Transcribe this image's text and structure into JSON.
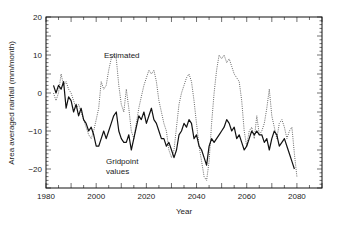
{
  "chart_data": {
    "type": "line",
    "title": "",
    "xlabel": "Year",
    "ylabel": "Area averaged rainfall (mm/month)",
    "xlim": [
      1980,
      2090
    ],
    "ylim": [
      -25,
      20
    ],
    "x_ticks": [
      1980,
      2000,
      2020,
      2040,
      2060,
      2080
    ],
    "x_tick_labels": [
      "1980",
      "2000",
      "2020",
      "2040",
      "2060",
      "2080"
    ],
    "y_ticks": [
      20,
      10,
      0,
      -10,
      -20
    ],
    "y_tick_labels": [
      "20",
      "10",
      "0",
      "−10",
      "−20"
    ],
    "grid": false,
    "legend": "none (inline annotations)",
    "annotations": [
      {
        "text": "Estimated",
        "x": 2009,
        "y": 14
      },
      {
        "text": "Gridpoint",
        "x": 2006,
        "y": -15
      },
      {
        "text": "values",
        "x": 2006,
        "y": -19
      }
    ],
    "series": [
      {
        "name": "Gridpoint values",
        "style": "solid",
        "color": "#111111",
        "x": [
          1983,
          1984,
          1985,
          1986,
          1987,
          1988,
          1989,
          1990,
          1991,
          1992,
          1993,
          1994,
          1995,
          1996,
          1997,
          1998,
          1999,
          2000,
          2001,
          2002,
          2003,
          2004,
          2005,
          2006,
          2007,
          2008,
          2009,
          2010,
          2011,
          2012,
          2013,
          2014,
          2015,
          2016,
          2017,
          2018,
          2019,
          2020,
          2021,
          2022,
          2023,
          2024,
          2025,
          2026,
          2027,
          2028,
          2029,
          2030,
          2031,
          2032,
          2033,
          2034,
          2035,
          2036,
          2037,
          2038,
          2039,
          2040,
          2041,
          2042,
          2043,
          2044,
          2045,
          2046,
          2047,
          2048,
          2049,
          2050,
          2051,
          2052,
          2053,
          2054,
          2055,
          2056,
          2057,
          2058,
          2059,
          2060,
          2061,
          2062,
          2063,
          2064,
          2065,
          2066,
          2067,
          2068,
          2069,
          2070,
          2071,
          2072,
          2073,
          2074,
          2075,
          2076,
          2077,
          2078,
          2079
        ],
        "values": [
          2,
          0,
          2,
          1,
          3,
          -4,
          -1,
          -2,
          -5,
          -3,
          -6,
          -4,
          -7,
          -8,
          -10,
          -9,
          -11,
          -14,
          -14,
          -12,
          -10,
          -12,
          -10,
          -8,
          -6,
          -5,
          -10,
          -12,
          -13,
          -13,
          -11,
          -15,
          -12,
          -9,
          -6,
          -7,
          -5,
          -8,
          -6,
          -4,
          -7,
          -8,
          -10,
          -12,
          -12,
          -14,
          -13,
          -15,
          -17,
          -15,
          -11,
          -10,
          -8,
          -9,
          -7,
          -8,
          -12,
          -11,
          -14,
          -15,
          -17,
          -19,
          -14,
          -12,
          -13,
          -12,
          -11,
          -10,
          -9,
          -7,
          -8,
          -10,
          -9,
          -12,
          -11,
          -13,
          -15,
          -14,
          -12,
          -10,
          -11,
          -10,
          -11,
          -11,
          -13,
          -12,
          -15,
          -12,
          -10,
          -11,
          -14,
          -13,
          -12,
          -14,
          -16,
          -18,
          -20
        ]
      },
      {
        "name": "Estimated",
        "style": "dotted",
        "color": "#444444",
        "x": [
          1983,
          1984,
          1985,
          1986,
          1987,
          1988,
          1989,
          1990,
          1991,
          1992,
          1993,
          1994,
          1995,
          1996,
          1997,
          1998,
          1999,
          2000,
          2001,
          2002,
          2003,
          2004,
          2005,
          2006,
          2007,
          2008,
          2009,
          2010,
          2011,
          2012,
          2013,
          2014,
          2015,
          2016,
          2017,
          2018,
          2019,
          2020,
          2021,
          2022,
          2023,
          2024,
          2025,
          2026,
          2027,
          2028,
          2029,
          2030,
          2031,
          2032,
          2033,
          2034,
          2035,
          2036,
          2037,
          2038,
          2039,
          2040,
          2041,
          2042,
          2043,
          2044,
          2045,
          2046,
          2047,
          2048,
          2049,
          2050,
          2051,
          2052,
          2053,
          2054,
          2055,
          2056,
          2057,
          2058,
          2059,
          2060,
          2061,
          2062,
          2063,
          2064,
          2065,
          2066,
          2067,
          2068,
          2069,
          2070,
          2071,
          2072,
          2073,
          2074,
          2075,
          2076,
          2077,
          2078,
          2079,
          2080
        ],
        "values": [
          0,
          -2,
          0,
          5,
          2,
          3,
          1,
          0,
          -2,
          -4,
          -3,
          -5,
          -7,
          -9,
          -11,
          -12,
          -10,
          -7,
          -4,
          3,
          1,
          2,
          6,
          9,
          10,
          9,
          2,
          -3,
          -5,
          1,
          -4,
          -10,
          -12,
          -8,
          -4,
          -1,
          2,
          4,
          6,
          5,
          6,
          3,
          -2,
          -5,
          -8,
          -10,
          -15,
          -17,
          -15,
          -9,
          -3,
          0,
          2,
          4,
          5,
          3,
          -2,
          -8,
          -14,
          -18,
          -22,
          -23,
          -18,
          -8,
          0,
          6,
          10,
          9,
          10,
          8,
          9,
          7,
          5,
          4,
          3,
          -2,
          -10,
          -14,
          -10,
          -9,
          -12,
          -6,
          -11,
          -10,
          -8,
          -4,
          1,
          -6,
          -9,
          -12,
          -8,
          -7,
          -9,
          -12,
          -10,
          -9,
          -16,
          -22
        ]
      }
    ]
  },
  "layout": {
    "plot": {
      "left": 46,
      "right": 322,
      "top": 17,
      "bottom": 188
    },
    "colors": {
      "axis": "#111111",
      "solid_line": "#111111",
      "dotted_line": "#444444",
      "background": "#ffffff"
    }
  }
}
